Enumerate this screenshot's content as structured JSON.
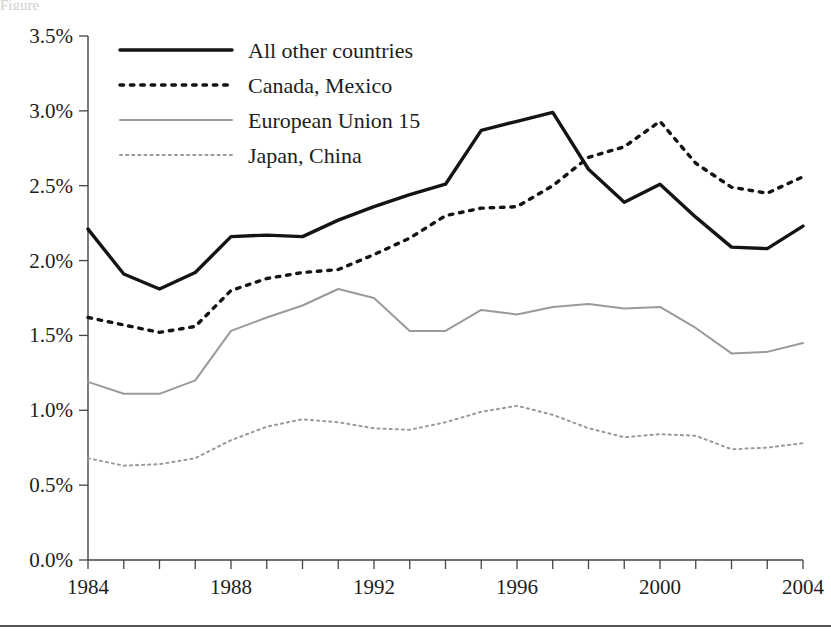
{
  "figure": {
    "cut_off_caption": "Figure",
    "background_color": "#ffffff",
    "footer_rule_color": "#555555"
  },
  "axes": {
    "y_ticks": [
      "0.0%",
      "0.5%",
      "1.0%",
      "1.5%",
      "2.0%",
      "2.5%",
      "3.0%",
      "3.5%"
    ],
    "x_ticks_labeled": [
      "1984",
      "1988",
      "1992",
      "1996",
      "2000",
      "2004"
    ]
  },
  "legend": {
    "position": "top-left-inside",
    "items": [
      {
        "label": "All other countries",
        "style": "solid",
        "color": "#141414",
        "width": 3.4
      },
      {
        "label": "Canada, Mexico",
        "style": "dotted",
        "color": "#141414",
        "width": 3.4
      },
      {
        "label": "European Union 15",
        "style": "solid",
        "color": "#9a9a9a",
        "width": 2.0
      },
      {
        "label": "Japan, China",
        "style": "dotted",
        "color": "#9a9a9a",
        "width": 2.0
      }
    ]
  },
  "chart_data": {
    "type": "line",
    "title": "",
    "subtitle": "",
    "xlabel": "",
    "ylabel": "",
    "xlim": [
      1984,
      2004
    ],
    "ylim": [
      0.0,
      3.5
    ],
    "y_unit": "%",
    "y_tick_step": 0.5,
    "x_tick_step_minor": 1,
    "x_tick_step_labeled": 4,
    "grid": false,
    "legend_position": "top-left-inside",
    "x": [
      1984,
      1985,
      1986,
      1987,
      1988,
      1989,
      1990,
      1991,
      1992,
      1993,
      1994,
      1995,
      1996,
      1997,
      1998,
      1999,
      2000,
      2001,
      2002,
      2003,
      2004
    ],
    "series": [
      {
        "name": "All other countries",
        "style": "solid",
        "color": "#141414",
        "values": [
          2.21,
          1.91,
          1.81,
          1.92,
          2.16,
          2.17,
          2.16,
          2.27,
          2.36,
          2.44,
          2.51,
          2.87,
          2.93,
          2.99,
          2.61,
          2.39,
          2.51,
          2.29,
          2.09,
          2.08,
          2.23
        ]
      },
      {
        "name": "Canada, Mexico",
        "style": "dotted",
        "color": "#141414",
        "values": [
          1.62,
          1.57,
          1.52,
          1.56,
          1.8,
          1.88,
          1.92,
          1.94,
          2.04,
          2.15,
          2.3,
          2.35,
          2.36,
          2.5,
          2.69,
          2.76,
          2.93,
          2.65,
          2.49,
          2.45,
          2.56
        ]
      },
      {
        "name": "European Union 15",
        "style": "solid",
        "color": "#9a9a9a",
        "values": [
          1.19,
          1.11,
          1.11,
          1.2,
          1.53,
          1.62,
          1.7,
          1.81,
          1.75,
          1.53,
          1.53,
          1.67,
          1.64,
          1.69,
          1.71,
          1.68,
          1.69,
          1.55,
          1.38,
          1.39,
          1.45
        ]
      },
      {
        "name": "Japan, China",
        "style": "dotted",
        "color": "#9a9a9a",
        "values": [
          0.68,
          0.63,
          0.64,
          0.68,
          0.8,
          0.89,
          0.94,
          0.92,
          0.88,
          0.87,
          0.92,
          0.99,
          1.03,
          0.97,
          0.88,
          0.82,
          0.84,
          0.83,
          0.74,
          0.75,
          0.78
        ]
      }
    ]
  }
}
